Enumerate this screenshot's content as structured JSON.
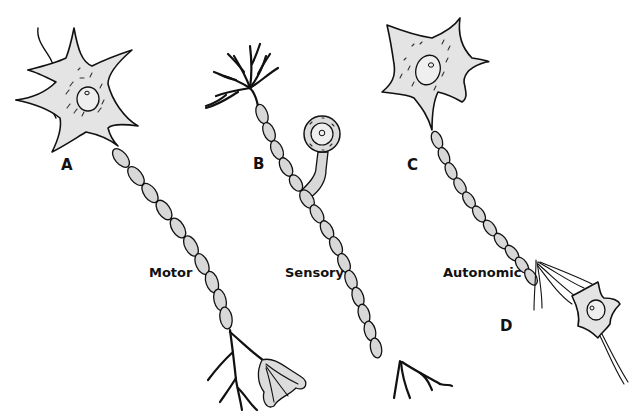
{
  "figure": {
    "labels": {
      "A": "A",
      "B": "B",
      "C": "C",
      "D": "D"
    },
    "neuron_types": {
      "motor": "Motor",
      "sensory": "Sensory",
      "autonomic": "Autonomic"
    }
  },
  "colors": {
    "background": "#ffffff",
    "cell_fill": "#e4e4e4",
    "outline": "#111111"
  }
}
